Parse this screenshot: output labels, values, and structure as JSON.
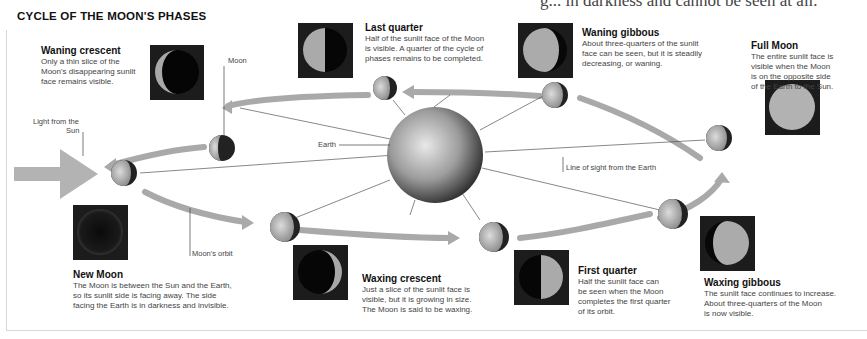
{
  "cut_off_header": "g... in darkness and cannot be seen at all.",
  "title": "CYCLE OF THE MOON'S PHASES",
  "labels": {
    "moon": "Moon",
    "light_from_sun_line1": "Light from the",
    "light_from_sun_line2": "Sun",
    "earth": "Earth",
    "line_of_sight": "Line of sight from the Earth",
    "moons_orbit": "Moon's orbit"
  },
  "phases": [
    {
      "id": "waning-crescent",
      "name": "Waning crescent",
      "desc_lines": [
        "Only a thin slice of the",
        "Moon's disappearing sunlit",
        "face remains visible."
      ]
    },
    {
      "id": "last-quarter",
      "name": "Last quarter",
      "desc_lines": [
        "Half of the sunlit face of the Moon",
        "is visible. A quarter of the cycle of",
        "phases remains to be completed."
      ]
    },
    {
      "id": "waning-gibbous",
      "name": "Waning gibbous",
      "desc_lines": [
        "About three-quarters of the sunlit",
        "face can be seen, but it is steadily",
        "decreasing, or waning."
      ]
    },
    {
      "id": "full-moon",
      "name": "Full Moon",
      "desc_lines": [
        "The entire sunlit face is",
        "visible when the Moon",
        "is on the opposite side",
        "of the Earth to the Sun."
      ]
    },
    {
      "id": "new-moon",
      "name": "New Moon",
      "desc_lines": [
        "The Moon is between the Sun and the Earth,",
        "so its sunlit side is facing away. The side",
        "facing the Earth is in darkness and invisible."
      ]
    },
    {
      "id": "waxing-crescent",
      "name": "Waxing crescent",
      "desc_lines": [
        "Just a slice of the sunlit face is",
        "visible, but it is growing in size.",
        "The Moon is said to be waxing."
      ]
    },
    {
      "id": "first-quarter",
      "name": "First quarter",
      "desc_lines": [
        "Half the sunlit face can",
        "be seen when the Moon",
        "completes the first quarter",
        "of its orbit."
      ]
    },
    {
      "id": "waxing-gibbous",
      "name": "Waxing gibbous",
      "desc_lines": [
        "The sunlit face continues to increase.",
        "About three-quarters of the Moon",
        "is now visible."
      ]
    }
  ],
  "colors": {
    "arrow": "#a9a9a9",
    "sun_arrow": "#b3b3b3",
    "photo_bg": "#1c1c1c",
    "moon_lit": "#bdbdbd",
    "moon_dark": "#222222",
    "earth": "#9a9a9a"
  }
}
